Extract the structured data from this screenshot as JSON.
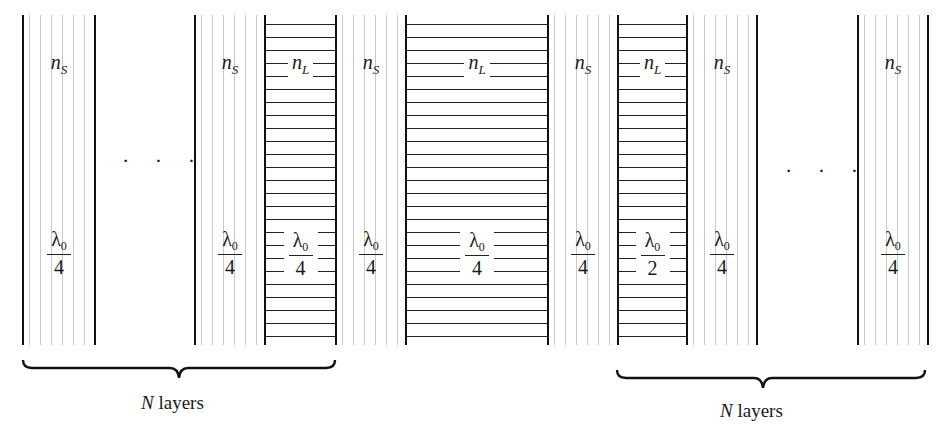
{
  "diagram": {
    "layers": [
      {
        "type": "S",
        "index_label": "n",
        "index_sub": "S",
        "thickness_num": "λ",
        "thickness_num_sub": "0",
        "thickness_den": "4",
        "x": 23,
        "w": 72
      },
      {
        "type": "S",
        "index_label": "n",
        "index_sub": "S",
        "thickness_num": "λ",
        "thickness_num_sub": "0",
        "thickness_den": "4",
        "x": 195,
        "w": 70
      },
      {
        "type": "L",
        "index_label": "n",
        "index_sub": "L",
        "thickness_num": "λ",
        "thickness_num_sub": "0",
        "thickness_den": "4",
        "x": 265,
        "w": 71
      },
      {
        "type": "S",
        "index_label": "n",
        "index_sub": "S",
        "thickness_num": "λ",
        "thickness_num_sub": "0",
        "thickness_den": "4",
        "x": 336,
        "w": 70
      },
      {
        "type": "L",
        "index_label": "n",
        "index_sub": "L",
        "thickness_num": "λ",
        "thickness_num_sub": "0",
        "thickness_den": "4",
        "x": 406,
        "w": 142
      },
      {
        "type": "S",
        "index_label": "n",
        "index_sub": "S",
        "thickness_num": "λ",
        "thickness_num_sub": "0",
        "thickness_den": "4",
        "x": 548,
        "w": 70
      },
      {
        "type": "L",
        "index_label": "n",
        "index_sub": "L",
        "thickness_num": "λ",
        "thickness_num_sub": "0",
        "thickness_den": "2",
        "x": 618,
        "w": 69
      },
      {
        "type": "S",
        "index_label": "n",
        "index_sub": "S",
        "thickness_num": "λ",
        "thickness_num_sub": "0",
        "thickness_den": "4",
        "x": 687,
        "w": 70
      },
      {
        "type": "S",
        "index_label": "n",
        "index_sub": "S",
        "thickness_num": "λ",
        "thickness_num_sub": "0",
        "thickness_den": "4",
        "x": 858,
        "w": 70
      }
    ],
    "ellipsis_left": "· · ·",
    "ellipsis_right": "· · ·",
    "brace_left": {
      "label_var": "N",
      "label_text": " layers"
    },
    "brace_right": {
      "label_var": "N",
      "label_text": " layers"
    }
  }
}
